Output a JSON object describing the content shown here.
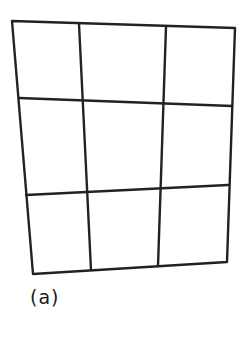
{
  "figure": {
    "label": "(a)",
    "stroke_color": "#222222",
    "grid": {
      "rows": 3,
      "cols": 3,
      "outer": [
        [
          12,
          21
        ],
        [
          235,
          28
        ],
        [
          227,
          262
        ],
        [
          33,
          274
        ]
      ],
      "horizontal_lines": [
        [
          [
            19,
            98
          ],
          [
            232,
            106
          ]
        ],
        [
          [
            26,
            195
          ],
          [
            228,
            185
          ]
        ]
      ],
      "vertical_lines": [
        [
          [
            79,
            24
          ],
          [
            91,
            270
          ]
        ],
        [
          [
            166,
            27
          ],
          [
            158,
            266
          ]
        ]
      ]
    }
  }
}
